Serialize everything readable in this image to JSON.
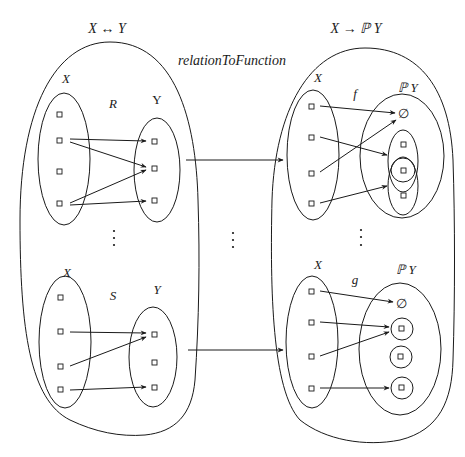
{
  "titles": {
    "left": "X ↔ Y",
    "right": "X → ℙ Y",
    "mapping": "relationToFunction"
  },
  "left_space": {
    "top_relation": {
      "name": "R",
      "domain_label": "X",
      "codomain_label": "Y",
      "domain_points": 4,
      "codomain_points": 3,
      "pairs": [
        [
          2,
          1
        ],
        [
          2,
          2
        ],
        [
          4,
          2
        ],
        [
          4,
          3
        ]
      ]
    },
    "ellipsis": "⋮",
    "bottom_relation": {
      "name": "S",
      "domain_label": "X",
      "codomain_label": "Y",
      "domain_points": 4,
      "codomain_points": 3,
      "pairs": [
        [
          2,
          1
        ],
        [
          3,
          1
        ],
        [
          4,
          3
        ]
      ]
    }
  },
  "right_space": {
    "top_function": {
      "name": "f",
      "domain_label": "X",
      "codomain_label": "ℙ Y",
      "empty_set": "∅",
      "codomain_elements": [
        "∅",
        "{a,b}",
        "{b}",
        "{b,c}"
      ],
      "mapping": [
        [
          "x1",
          "∅"
        ],
        [
          "x2",
          "{a,b}"
        ],
        [
          "x3",
          "∅"
        ],
        [
          "x4",
          "{b,c}"
        ]
      ]
    },
    "ellipsis": "⋮",
    "bottom_function": {
      "name": "g",
      "domain_label": "X",
      "codomain_label": "ℙ Y",
      "empty_set": "∅",
      "codomain_elements": [
        "∅",
        "{a}",
        "{b}",
        "{c}"
      ],
      "mapping": [
        [
          "x1",
          "∅"
        ],
        [
          "x2",
          "{a}"
        ],
        [
          "x3",
          "{a}"
        ],
        [
          "x4",
          "{c}"
        ]
      ]
    }
  },
  "middle_ellipsis": "⋮"
}
